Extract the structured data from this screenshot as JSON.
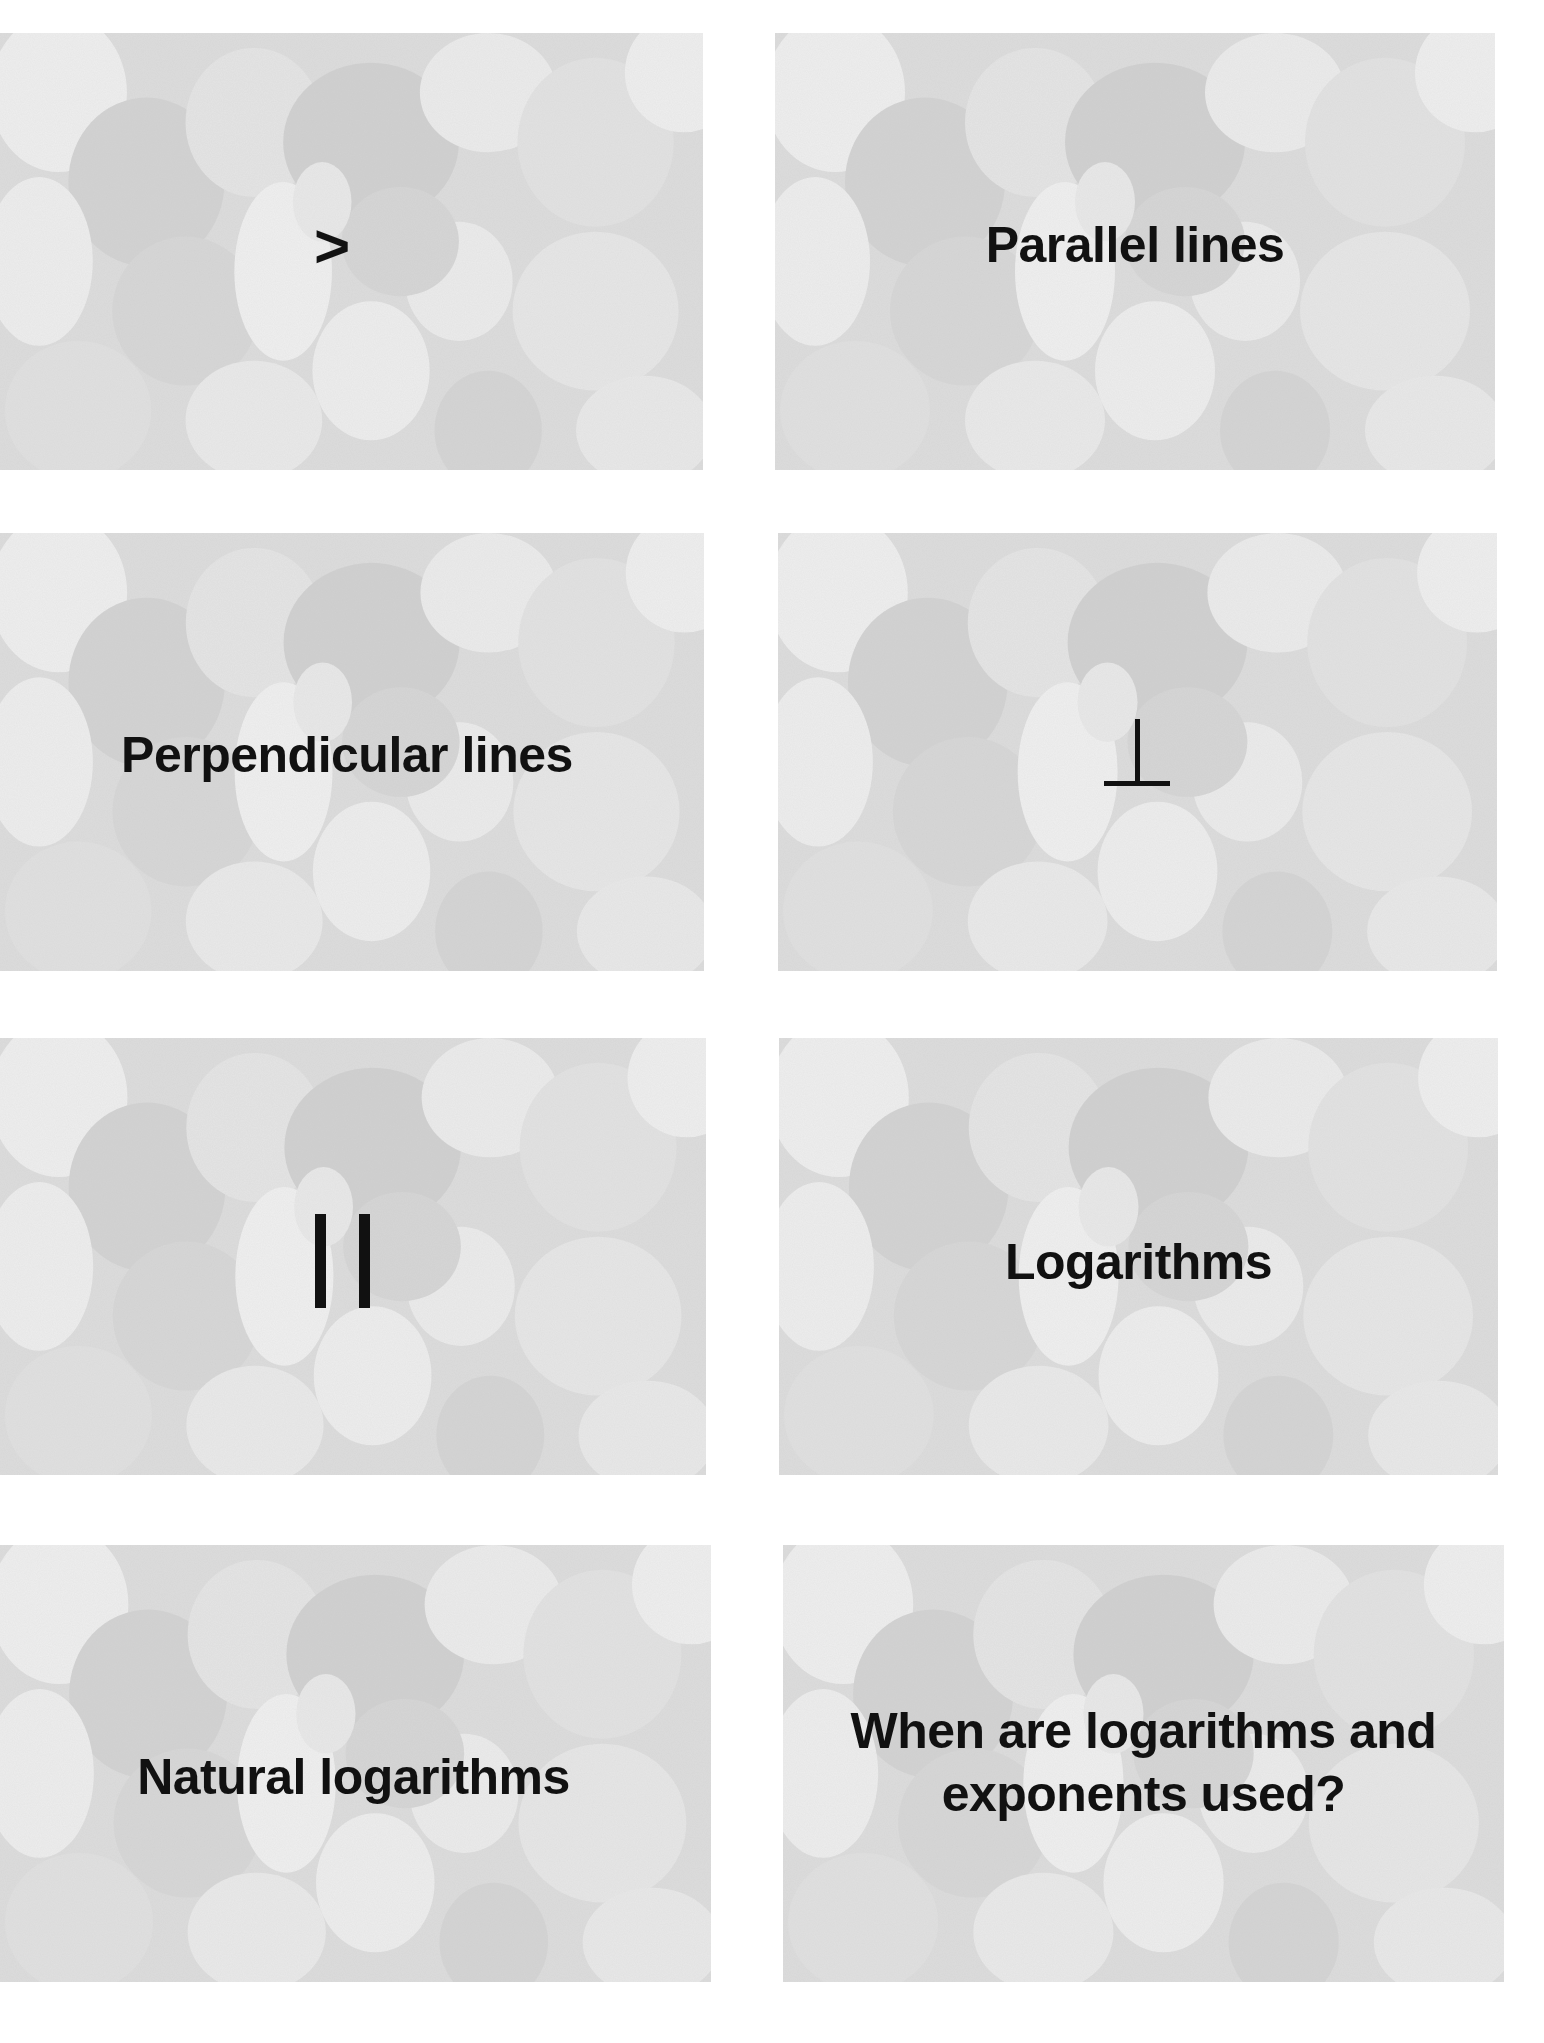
{
  "page": {
    "background": "#ffffff",
    "card_texture_colors": {
      "base": "#dcdcdc",
      "light": "#eeeeee",
      "dark": "#cfcfcf",
      "text": "#111111"
    }
  },
  "cards": [
    {
      "side": "front",
      "content_type": "symbol",
      "symbol": ">",
      "symbol_name": "greater-than"
    },
    {
      "side": "back",
      "content_type": "text",
      "label": "Parallel lines"
    },
    {
      "side": "front",
      "content_type": "text",
      "label": "Perpendicular lines"
    },
    {
      "side": "back",
      "content_type": "symbol",
      "symbol": "⊥",
      "symbol_name": "perpendicular"
    },
    {
      "side": "front",
      "content_type": "symbol",
      "symbol": "||",
      "symbol_name": "parallel"
    },
    {
      "side": "back",
      "content_type": "text",
      "label": "Logarithms"
    },
    {
      "side": "front",
      "content_type": "text",
      "label": "Natural logarithms"
    },
    {
      "side": "back",
      "content_type": "text",
      "label": "When are logarithms and\nexponents used?"
    }
  ]
}
